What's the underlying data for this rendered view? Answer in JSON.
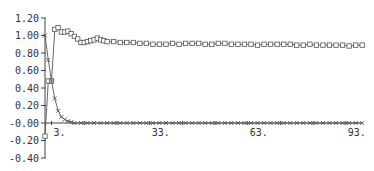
{
  "chart_data": {
    "type": "line",
    "title": "",
    "xlabel": "",
    "ylabel": "",
    "xlim": [
      1,
      98
    ],
    "ylim": [
      -0.4,
      1.2
    ],
    "grid": false,
    "legend": null,
    "x_ticks": [
      3,
      33,
      63,
      93
    ],
    "x_tick_labels": [
      "3.",
      "33.",
      "63.",
      "93."
    ],
    "y_ticks": [
      1.2,
      1.0,
      0.8,
      0.6,
      0.4,
      0.2,
      0.0,
      -0.2,
      -0.4
    ],
    "y_tick_labels": [
      "1.20",
      "1.00",
      "0.80",
      "0.60",
      "0.40",
      "0.20",
      "-0.00",
      "-0.20",
      "-0.40"
    ],
    "series": [
      {
        "name": "square-marker series",
        "marker": "square",
        "x": [
          1,
          2,
          3,
          4,
          5,
          6,
          7,
          8,
          9,
          10,
          11,
          12,
          13,
          14,
          15,
          16,
          17,
          18,
          19,
          20,
          22,
          24,
          26,
          28,
          30,
          32,
          34,
          36,
          38,
          40,
          42,
          44,
          46,
          48,
          50,
          52,
          54,
          56,
          58,
          60,
          62,
          64,
          66,
          68,
          70,
          72,
          74,
          76,
          78,
          80,
          82,
          84,
          86,
          88,
          90,
          92,
          94,
          96,
          98
        ],
        "values": [
          -0.15,
          0.48,
          0.48,
          1.07,
          1.09,
          1.04,
          1.04,
          1.05,
          1.02,
          0.99,
          0.96,
          0.92,
          0.92,
          0.93,
          0.94,
          0.95,
          0.97,
          0.95,
          0.94,
          0.93,
          0.93,
          0.92,
          0.92,
          0.92,
          0.91,
          0.91,
          0.9,
          0.9,
          0.9,
          0.91,
          0.9,
          0.91,
          0.91,
          0.91,
          0.9,
          0.9,
          0.91,
          0.91,
          0.9,
          0.9,
          0.9,
          0.9,
          0.89,
          0.9,
          0.9,
          0.9,
          0.9,
          0.9,
          0.89,
          0.89,
          0.9,
          0.89,
          0.89,
          0.89,
          0.89,
          0.89,
          0.88,
          0.89,
          0.89
        ]
      },
      {
        "name": "x-marker series",
        "marker": "x",
        "x": [
          1,
          2,
          3,
          4,
          5,
          6,
          7,
          8,
          9,
          10,
          12,
          14,
          16,
          18,
          20,
          22,
          24,
          26,
          28,
          30,
          32,
          34,
          36,
          38,
          40,
          42,
          44,
          46,
          48,
          50,
          52,
          54,
          56,
          58,
          60,
          62,
          64,
          66,
          68,
          70,
          72,
          74,
          76,
          78,
          80,
          82,
          84,
          86,
          88,
          90,
          92,
          94,
          96,
          98
        ],
        "values": [
          1.0,
          0.72,
          0.48,
          0.28,
          0.14,
          0.07,
          0.04,
          0.02,
          0.01,
          0.0,
          0.0,
          0.0,
          0.0,
          0.0,
          0.0,
          0.0,
          0.0,
          0.0,
          0.0,
          0.0,
          0.0,
          0.0,
          0.0,
          0.0,
          0.0,
          0.0,
          0.0,
          0.0,
          0.0,
          0.0,
          0.0,
          0.0,
          0.0,
          0.0,
          0.0,
          0.0,
          0.0,
          0.0,
          0.0,
          0.0,
          0.0,
          0.0,
          0.0,
          0.0,
          0.0,
          0.0,
          0.0,
          0.0,
          0.0,
          0.0,
          0.0,
          0.0,
          0.0,
          0.0
        ]
      }
    ]
  },
  "colors": {
    "line": "#555555",
    "axis": "#444444",
    "background": "#ffffff"
  }
}
